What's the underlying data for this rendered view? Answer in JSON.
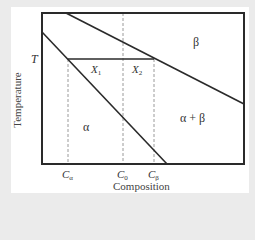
{
  "diagram": {
    "axes": {
      "xlabel": "Composition",
      "ylabel": "Temperature",
      "temperature_marker": "T"
    },
    "regions": {
      "alpha": "α",
      "beta": "β",
      "alpha_beta": "α + β"
    },
    "tie_line": {
      "x1_label": "X",
      "x1_sub": "1",
      "x2_label": "X",
      "x2_sub": "2"
    },
    "composition_ticks": [
      {
        "label": "C",
        "sub": "α"
      },
      {
        "label": "C",
        "sub": "0"
      },
      {
        "label": "C",
        "sub": "β"
      }
    ],
    "colors": {
      "line": "#2a2a2a",
      "dashed": "#999999",
      "background": "#ebebeb",
      "card": "#ffffff"
    }
  }
}
